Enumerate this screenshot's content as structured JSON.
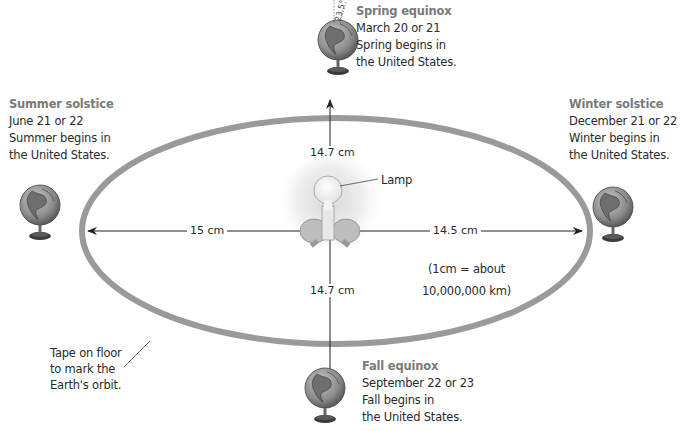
{
  "diagram": {
    "orbit_label": [
      "Tape on floor",
      "to mark the",
      "Earth's orbit."
    ],
    "lamp_label": "Lamp",
    "tilt_label": "23.5°",
    "scale_note": [
      "(1cm = about",
      "10,000,000 km)"
    ],
    "measurements": {
      "top": "14.7 cm",
      "bottom": "14.7 cm",
      "left": "15 cm",
      "right": "14.5 cm"
    },
    "positions": [
      {
        "id": "spring",
        "title": "Spring equinox",
        "lines": [
          "March 20 or 21",
          "Spring begins in",
          "the United States."
        ]
      },
      {
        "id": "summer",
        "title": "Summer solstice",
        "lines": [
          "June 21 or 22",
          "Summer begins in",
          "the United States."
        ]
      },
      {
        "id": "winter",
        "title": "Winter solstice",
        "lines": [
          "December 21 or 22",
          "Winter begins in",
          "the United States."
        ]
      },
      {
        "id": "fall",
        "title": "Fall equinox",
        "lines": [
          "September 22 or 23",
          "Fall begins in",
          "the United States."
        ]
      }
    ],
    "colors": {
      "orbit": "#9a9a9a",
      "title_text": "#7a7a7a",
      "text": "#2a2a2a",
      "globe": "#8c8c8c"
    }
  }
}
